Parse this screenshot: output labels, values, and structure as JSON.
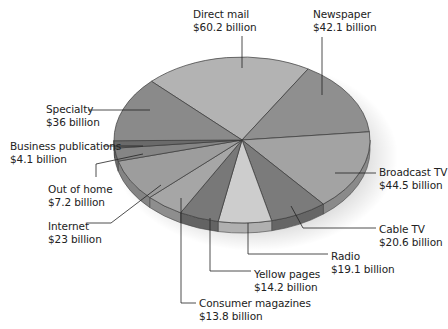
{
  "chart_data": {
    "type": "pie",
    "title": "",
    "unit": "billion USD",
    "start_angle_deg": -135,
    "center": [
      242,
      140
    ],
    "rx": 128,
    "ry": 83,
    "depth": 10,
    "slices": [
      {
        "name": "Direct mail",
        "value": 60.2,
        "label": "$60.2 billion",
        "color": "#b3b3b3",
        "side": "#9a9a9a"
      },
      {
        "name": "Newspaper",
        "value": 42.1,
        "label": "$42.1 billion",
        "color": "#8f8f8f",
        "side": "#777777"
      },
      {
        "name": "Broadcast TV",
        "value": 44.5,
        "label": "$44.5 billion",
        "color": "#a3a3a3",
        "side": "#8a8a8a"
      },
      {
        "name": "Cable TV",
        "value": 20.6,
        "label": "$20.6 billion",
        "color": "#7b7b7b",
        "side": "#666666"
      },
      {
        "name": "Radio",
        "value": 19.1,
        "label": "$19.1 billion",
        "color": "#cdcdcd",
        "side": "#b0b0b0"
      },
      {
        "name": "Yellow pages",
        "value": 14.2,
        "label": "$14.2 billion",
        "color": "#787878",
        "side": "#636363"
      },
      {
        "name": "Consumer magazines",
        "value": 13.8,
        "label": "$13.8 billion",
        "color": "#a6a6a6",
        "side": "#8e8e8e"
      },
      {
        "name": "Internet",
        "value": 23.0,
        "label": "$23 billion",
        "color": "#9d9d9d",
        "side": "#848484"
      },
      {
        "name": "Out of home",
        "value": 7.2,
        "label": "$7.2 billion",
        "color": "#858585",
        "side": "#6e6e6e"
      },
      {
        "name": "Business publications",
        "value": 4.1,
        "label": "$4.1 billion",
        "color": "#6a6a6a",
        "side": "#555555"
      },
      {
        "name": "Specialty",
        "value": 36.0,
        "label": "$36 billion",
        "color": "#8a8a8a",
        "side": "#737373"
      }
    ],
    "legend": "none (leader-line labels)"
  },
  "labels": [
    {
      "name": "Direct mail",
      "value": "$60.2 billion",
      "x": 193,
      "y": 8,
      "align": "left",
      "line": [
        [
          242,
          36
        ],
        [
          242,
          68
        ]
      ]
    },
    {
      "name": "Newspaper",
      "value": "$42.1 billion",
      "x": 313,
      "y": 8,
      "align": "left",
      "line": [
        [
          322,
          37
        ],
        [
          322,
          95
        ]
      ]
    },
    {
      "name": "Specialty",
      "value": "$36 billion",
      "x": 46,
      "y": 103,
      "align": "left",
      "line": [
        [
          88,
          110
        ],
        [
          150,
          110
        ]
      ]
    },
    {
      "name": "Business publications",
      "value": "$4.1 billion",
      "x": 10,
      "y": 140,
      "align": "left",
      "line": [
        [
          103,
          146
        ],
        [
          143,
          146
        ]
      ]
    },
    {
      "name": "Out of home",
      "value": "$7.2 billion",
      "x": 48,
      "y": 183,
      "align": "left",
      "line": [
        [
          96,
          177
        ],
        [
          96,
          164
        ],
        [
          143,
          154
        ]
      ]
    },
    {
      "name": "Internet",
      "value": "$23 billion",
      "x": 48,
      "y": 220,
      "align": "left",
      "line": [
        [
          87,
          223
        ],
        [
          111,
          223
        ],
        [
          161,
          185
        ]
      ]
    },
    {
      "name": "Broadcast TV",
      "value": "$44.5 billion",
      "x": 379,
      "y": 166,
      "align": "left",
      "line": [
        [
          335,
          173
        ],
        [
          376,
          173
        ]
      ]
    },
    {
      "name": "Cable TV",
      "value": "$20.6 billion",
      "x": 379,
      "y": 223,
      "align": "left",
      "line": [
        [
          291,
          206
        ],
        [
          303,
          228
        ],
        [
          376,
          228
        ]
      ]
    },
    {
      "name": "Radio",
      "value": "$19.1 billion",
      "x": 331,
      "y": 250,
      "align": "left",
      "line": [
        [
          248,
          223
        ],
        [
          248,
          254
        ],
        [
          328,
          254
        ]
      ]
    },
    {
      "name": "Yellow pages",
      "value": "$14.2 billion",
      "x": 254,
      "y": 268,
      "align": "left",
      "line": [
        [
          210,
          218
        ],
        [
          210,
          271
        ],
        [
          251,
          271
        ]
      ]
    },
    {
      "name": "Consumer magazines",
      "value": "$13.8 billion",
      "x": 199,
      "y": 297,
      "align": "left",
      "line": [
        [
          181,
          198
        ],
        [
          181,
          303
        ],
        [
          196,
          303
        ]
      ]
    }
  ]
}
